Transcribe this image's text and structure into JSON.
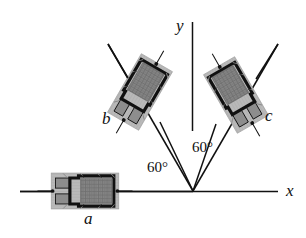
{
  "figure": {
    "kind": "physics-diagram",
    "background": "#ffffff",
    "ink_color": "#111111"
  },
  "axes": {
    "origin": {
      "x": 193,
      "y": 191
    },
    "x_axis": {
      "label": "x",
      "label_x": 286,
      "label_y": 183,
      "x1": 20,
      "y1": 191,
      "x2": 278,
      "y2": 191
    },
    "y_axis": {
      "label": "y",
      "label_x": 176,
      "label_y": 18,
      "x1": 192,
      "y1": 22,
      "x2": 192,
      "y2": 131
    }
  },
  "angles": [
    {
      "name": "angle-left",
      "text": "60°",
      "x": 147,
      "y": 160
    },
    {
      "name": "angle-right",
      "text": "60°",
      "x": 192,
      "y": 140
    }
  ],
  "devices": [
    {
      "id": "a",
      "label": "a",
      "label_x": 84,
      "label_y": 210,
      "center_x": 85,
      "center_y": 191,
      "rotation_deg": 0,
      "axis_angle_deg": 180,
      "frame_color": "#b5b5b5",
      "body_color": "#8f8f8f",
      "core_color": "#808080",
      "outline_color": "#111111"
    },
    {
      "id": "b",
      "label": "b",
      "label_x": 102,
      "label_y": 110,
      "center_x": 140,
      "center_y": 92,
      "rotation_deg": 120,
      "axis_angle_deg": 120,
      "frame_color": "#b5b5b5",
      "body_color": "#8f8f8f",
      "core_color": "#808080",
      "outline_color": "#111111"
    },
    {
      "id": "c",
      "label": "c",
      "label_x": 265,
      "label_y": 107,
      "center_x": 236,
      "center_y": 95,
      "rotation_deg": 60,
      "axis_angle_deg": 60,
      "frame_color": "#b5b5b5",
      "body_color": "#8f8f8f",
      "core_color": "#808080",
      "outline_color": "#111111"
    }
  ],
  "rays": [
    {
      "name": "ray-a",
      "x1": 20,
      "y1": 191,
      "x2": 193,
      "y2": 191
    },
    {
      "name": "ray-b",
      "x1": 193,
      "y1": 191,
      "x2": 108,
      "y2": 44
    },
    {
      "name": "ray-c",
      "x1": 193,
      "y1": 191,
      "x2": 278,
      "y2": 44
    }
  ]
}
